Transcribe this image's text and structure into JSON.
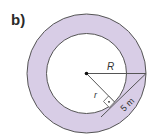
{
  "figure": {
    "label": "b)",
    "outer_radius_label": "R",
    "inner_radius_label": "r",
    "tangent_length_label": "5 m",
    "colors": {
      "annulus_fill": "#d8cde6",
      "stroke": "#555555",
      "inner_fill": "#ffffff"
    }
  }
}
